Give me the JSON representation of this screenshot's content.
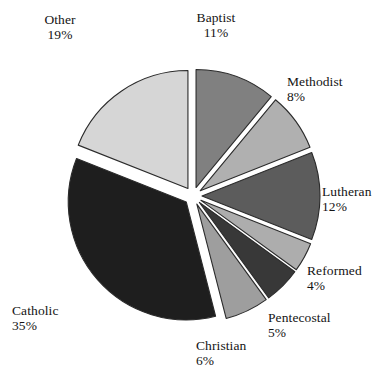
{
  "chart_data": {
    "type": "pie",
    "title": "",
    "subtitle": "",
    "xlabel": "",
    "ylabel": "",
    "legend_position": "none",
    "grid": false,
    "exploded": true,
    "units": "percent",
    "start_angle_deg": 0,
    "direction": "clockwise",
    "categories": [
      "Baptist",
      "Methodist",
      "Lutheran",
      "Reformed",
      "Pentecostal",
      "Christian",
      "Catholic",
      "Other"
    ],
    "values": [
      11,
      8,
      12,
      4,
      5,
      6,
      35,
      19
    ],
    "total": 100,
    "slices": [
      {
        "label": "Baptist",
        "value": 11,
        "percent_text": "11%",
        "color": "#808080",
        "start_deg": 0,
        "end_deg": 39.6,
        "label_x": 216,
        "label_y": 10,
        "label_align": "center"
      },
      {
        "label": "Methodist",
        "value": 8,
        "percent_text": "8%",
        "color": "#b0b0b0",
        "start_deg": 39.6,
        "end_deg": 68.4,
        "label_x": 287,
        "label_y": 74,
        "label_align": "left"
      },
      {
        "label": "Lutheran",
        "value": 12,
        "percent_text": "12%",
        "color": "#5c5c5c",
        "start_deg": 68.4,
        "end_deg": 111.6,
        "label_x": 322,
        "label_y": 184,
        "label_align": "left"
      },
      {
        "label": "Reformed",
        "value": 4,
        "percent_text": "4%",
        "color": "#adadad",
        "start_deg": 111.6,
        "end_deg": 126.0,
        "label_x": 307,
        "label_y": 263,
        "label_align": "left"
      },
      {
        "label": "Pentecostal",
        "value": 5,
        "percent_text": "5%",
        "color": "#383838",
        "start_deg": 126.0,
        "end_deg": 144.0,
        "label_x": 268,
        "label_y": 310,
        "label_align": "left"
      },
      {
        "label": "Christian",
        "value": 6,
        "percent_text": "6%",
        "color": "#9e9e9e",
        "start_deg": 144.0,
        "end_deg": 165.6,
        "label_x": 196,
        "label_y": 338,
        "label_align": "left"
      },
      {
        "label": "Catholic",
        "value": 35,
        "percent_text": "35%",
        "color": "#1e1e1e",
        "start_deg": 165.6,
        "end_deg": 291.6,
        "label_x": 12,
        "label_y": 303,
        "label_align": "left"
      },
      {
        "label": "Other",
        "value": 19,
        "percent_text": "19%",
        "color": "#d6d6d6",
        "start_deg": 291.6,
        "end_deg": 360.0,
        "label_x": 60,
        "label_y": 12,
        "label_align": "center"
      }
    ],
    "geometry": {
      "center_x": 193,
      "center_y": 196,
      "radius": 118,
      "explode_offset": 9
    },
    "style": {
      "background": "#ffffff",
      "outline_color": "#2b2b2b",
      "text_color": "#141414"
    }
  }
}
